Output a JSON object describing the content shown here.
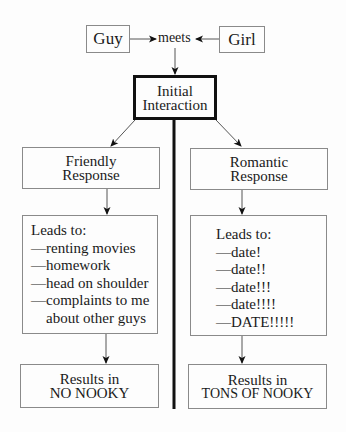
{
  "diagram": {
    "top": {
      "guy": "Guy",
      "meets": "meets",
      "girl": "Girl"
    },
    "initial": {
      "line1": "Initial",
      "line2": "Interaction"
    },
    "friendly": {
      "response": {
        "line1": "Friendly",
        "line2": "Response"
      },
      "leads_heading": "Leads to:",
      "leads_items": [
        "—renting movies",
        "—homework",
        "—head on shoulder",
        "—complaints to me",
        "about other guys"
      ],
      "result": {
        "line1": "Results in",
        "line2": "NO NOOKY"
      }
    },
    "romantic": {
      "response": {
        "line1": "Romantic",
        "line2": "Response"
      },
      "leads_heading": "Leads to:",
      "leads_items": [
        "—date!",
        "—date!!",
        "—date!!!",
        "—date!!!!",
        "—DATE!!!!!"
      ],
      "result": {
        "line1": "Results in",
        "line2": "TONS OF NOOKY"
      }
    },
    "colors": {
      "line": "#111111",
      "box_border": "#8a8a8a",
      "background": "#fdfdfd"
    }
  }
}
